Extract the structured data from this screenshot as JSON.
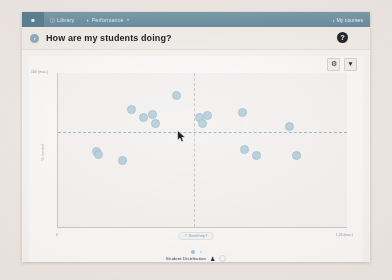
{
  "nav": {
    "home_icon": "home-icon",
    "items": [
      {
        "icon": "library-icon",
        "label": "Library",
        "caret": ""
      },
      {
        "icon": "performance-icon",
        "label": "Performance",
        "caret": "▾"
      }
    ],
    "right_link": {
      "chevron": "‹",
      "label": "My courses"
    }
  },
  "header": {
    "back_icon": "‹",
    "title": "How are my students doing?",
    "help_icon": "?"
  },
  "toolbar": {
    "settings_icon": "⚙",
    "filter_icon": "▼"
  },
  "footer": {
    "help_pill": {
      "icon": "?",
      "label": "Need help?"
    },
    "legend_label": "Student Distribution",
    "legend_person_icon": "♟"
  },
  "chart_data": {
    "type": "scatter",
    "title": "",
    "xlabel": "",
    "ylabel": "% correct",
    "x_min_label": "0",
    "x_max_label": "1.23 (max.)",
    "y_max_label": "100 (max.)",
    "y_min_label": "0",
    "xlim": [
      0,
      1.23
    ],
    "ylim": [
      0,
      100
    ],
    "grid": false,
    "legend_position": "bottom",
    "reference_lines": [
      {
        "orientation": "horizontal",
        "value": 62,
        "style": "dashed",
        "color": "#9ebccb"
      },
      {
        "orientation": "vertical",
        "value": 0.58,
        "style": "dashed",
        "color": "#cfcac6"
      }
    ],
    "series": [
      {
        "name": "Student Distribution",
        "color": "#b8d2dd",
        "points": [
          {
            "x": 0.31,
            "y": 77
          },
          {
            "x": 0.36,
            "y": 72
          },
          {
            "x": 0.4,
            "y": 74
          },
          {
            "x": 0.41,
            "y": 68
          },
          {
            "x": 0.5,
            "y": 86
          },
          {
            "x": 0.6,
            "y": 72
          },
          {
            "x": 0.63,
            "y": 73
          },
          {
            "x": 0.61,
            "y": 68
          },
          {
            "x": 0.78,
            "y": 75
          },
          {
            "x": 0.98,
            "y": 66
          },
          {
            "x": 0.16,
            "y": 50
          },
          {
            "x": 0.17,
            "y": 48
          },
          {
            "x": 0.27,
            "y": 44
          },
          {
            "x": 0.79,
            "y": 51
          },
          {
            "x": 0.84,
            "y": 47
          },
          {
            "x": 1.01,
            "y": 47
          }
        ]
      }
    ]
  }
}
